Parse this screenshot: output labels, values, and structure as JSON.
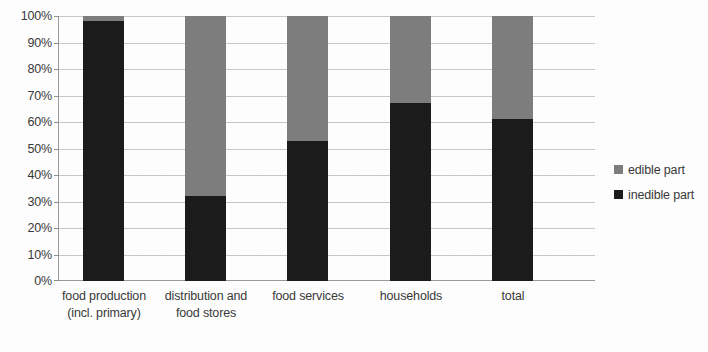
{
  "chart_data": {
    "type": "bar",
    "stacked": true,
    "stack_mode": "percent",
    "title": "",
    "subtitle": "",
    "xlabel": "",
    "ylabel": "",
    "ylim": [
      0,
      100
    ],
    "yticks": [
      "0%",
      "10%",
      "20%",
      "30%",
      "40%",
      "50%",
      "60%",
      "70%",
      "80%",
      "90%",
      "100%"
    ],
    "ytick_values": [
      0,
      10,
      20,
      30,
      40,
      50,
      60,
      70,
      80,
      90,
      100
    ],
    "grid": true,
    "legend_position": "right",
    "categories": [
      "food production (incl. primary)",
      "distribution and food stores",
      "food services",
      "households",
      "total"
    ],
    "category_lines": [
      [
        "food production",
        "(incl. primary)"
      ],
      [
        "distribution and",
        "food stores"
      ],
      [
        "food services",
        ""
      ],
      [
        "households",
        ""
      ],
      [
        "total",
        ""
      ]
    ],
    "series": [
      {
        "name": "inedible part",
        "color": "#1c1c1c",
        "values": [
          98,
          32,
          53,
          67,
          61
        ]
      },
      {
        "name": "edible part",
        "color": "#7e7e7e",
        "values": [
          2,
          68,
          47,
          33,
          39
        ]
      }
    ],
    "legend_entries": [
      {
        "label": "edible part",
        "color": "#7e7e7e"
      },
      {
        "label": "inedible part",
        "color": "#1c1c1c"
      }
    ],
    "colors": {
      "edible": "#7e7e7e",
      "inedible": "#1c1c1c",
      "grid": "#c9c9c9",
      "axis": "#9a9a9a",
      "text": "#3a3a3a",
      "background": "#ffffff"
    }
  }
}
